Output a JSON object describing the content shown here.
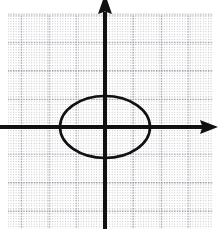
{
  "figure": {
    "name": "ellipse-on-dotted-grid",
    "width": 221,
    "height": 229,
    "background_color": "#ffffff",
    "caption": ""
  },
  "chart_data": {
    "type": "scatter",
    "title": "",
    "subtitle": "",
    "xlabel": "",
    "ylabel": "",
    "tick_labels": {
      "x": [],
      "y": []
    },
    "legend": {
      "entries": [],
      "position": "none"
    },
    "grid": {
      "visible": true,
      "style": "dotted",
      "color": "#b9b9bf",
      "minor_spacing_px": 2.6,
      "major_spacing_px": 28,
      "extent_px": {
        "left": 8,
        "top": 15,
        "right": 213,
        "bottom": 229
      }
    },
    "axes": {
      "color": "#111111",
      "line_width_px": 4,
      "origin_px": {
        "x": 105,
        "y": 127
      },
      "x_axis": {
        "from_px": {
          "x": 0,
          "y": 127
        },
        "to_px": {
          "x": 218,
          "y": 127
        },
        "arrow": "right",
        "range_units": [
          -3.7,
          4.0
        ]
      },
      "y_axis": {
        "from_px": {
          "x": 105,
          "y": 229
        },
        "to_px": {
          "x": 105,
          "y": 3
        },
        "arrow": "up",
        "range_units": [
          -3.6,
          4.4
        ]
      },
      "unit_px": 28
    },
    "shapes": [
      {
        "kind": "ellipse",
        "label": "ellipse",
        "stroke_color": "#111111",
        "stroke_width_px": 2.6,
        "fill": "none",
        "center_px": {
          "x": 105,
          "y": 127
        },
        "radius_px": {
          "x": 45,
          "y": 31
        },
        "center_units": {
          "x": 0,
          "y": 0
        },
        "semi_axis_units": {
          "a": 1.6,
          "b": 1.1
        },
        "annotations": []
      }
    ]
  }
}
